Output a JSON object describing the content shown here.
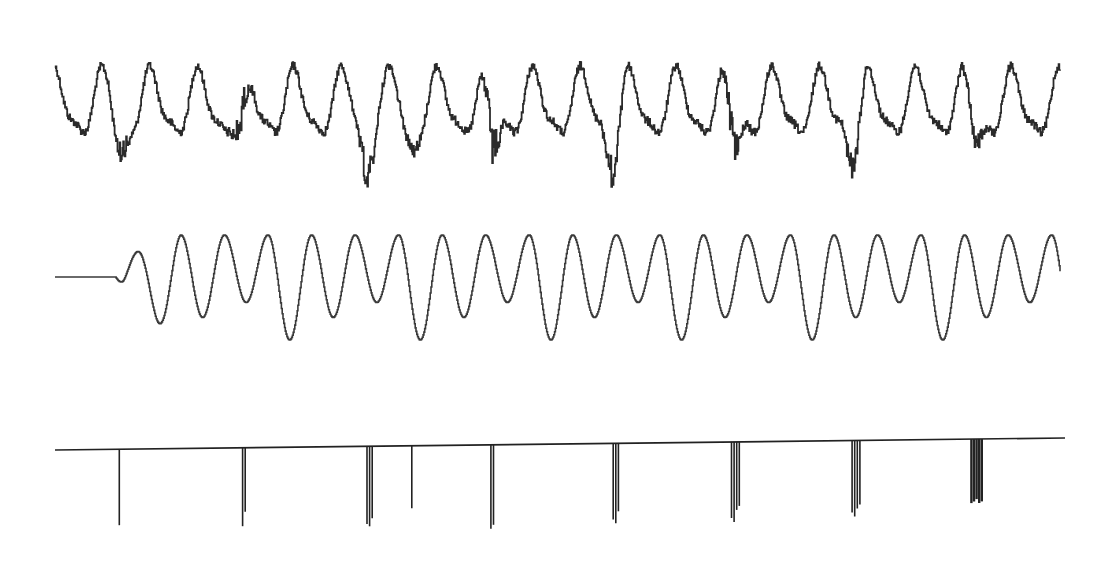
{
  "chart_data": [
    {
      "type": "line",
      "name": "composite-signal",
      "description": "Noisy quasi-periodic waveform with sharp dips aligned to spike clusters",
      "title": "",
      "xlabel": "",
      "ylabel": "",
      "grid": false,
      "x_range": [
        0,
        1
      ],
      "y_range": [
        -1,
        1
      ],
      "cycles": 21,
      "noise_level": 0.18,
      "dip_positions": [
        0.065,
        0.185,
        0.31,
        0.355,
        0.435,
        0.555,
        0.675,
        0.795,
        0.915
      ],
      "dip_depths": [
        0.55,
        0.75,
        0.85,
        0.4,
        0.9,
        0.8,
        0.75,
        0.75,
        0.6
      ],
      "color": "#2a2a2a"
    },
    {
      "type": "line",
      "name": "filtered-sinusoid",
      "description": "Flat lead-in then stepped sinusoidal oscillation with alternating large and small troughs",
      "title": "",
      "xlabel": "",
      "ylabel": "",
      "grid": false,
      "x_range": [
        0,
        1
      ],
      "y_range": [
        -1,
        1
      ],
      "onset": 0.06,
      "peaks_count": 22,
      "color": "#3a3a3a"
    },
    {
      "type": "line",
      "name": "impulse-train",
      "description": "Baseline with downward spike clusters",
      "title": "",
      "xlabel": "",
      "ylabel": "",
      "grid": false,
      "x_range": [
        0,
        1
      ],
      "y_range": [
        -1,
        0
      ],
      "spikes": [
        {
          "x": 0.064,
          "depths": [
            0.95
          ],
          "count": 1
        },
        {
          "x": 0.188,
          "depths": [
            0.98,
            0.8
          ],
          "count": 2
        },
        {
          "x": 0.313,
          "depths": [
            0.97,
            1.0,
            0.9
          ],
          "count": 3
        },
        {
          "x": 0.355,
          "depths": [
            0.78
          ],
          "count": 1
        },
        {
          "x": 0.435,
          "depths": [
            1.05,
            1.0
          ],
          "count": 2
        },
        {
          "x": 0.558,
          "depths": [
            0.95,
            1.0,
            0.85
          ],
          "count": 3
        },
        {
          "x": 0.677,
          "depths": [
            0.95,
            1.0,
            0.85,
            0.8
          ],
          "count": 4
        },
        {
          "x": 0.797,
          "depths": [
            0.9,
            0.95,
            0.85,
            0.8
          ],
          "count": 4
        },
        {
          "x": 0.917,
          "depths": [
            0.8,
            0.78,
            0.75
          ],
          "count": 5
        }
      ],
      "color": "#222222"
    }
  ]
}
